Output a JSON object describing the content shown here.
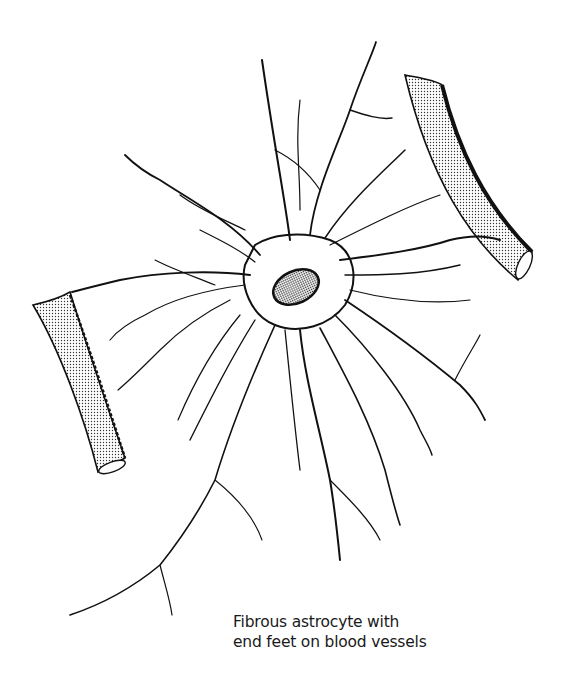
{
  "figure": {
    "subject": "Fibrous astrocyte",
    "caption_lines": [
      "Fibrous astrocyte with",
      "end feet on blood vessels"
    ],
    "elements": [
      "cell-body",
      "nucleus",
      "processes",
      "blood-vessel-left",
      "blood-vessel-right"
    ]
  },
  "colors": {
    "ink": "#111111",
    "background": "#ffffff"
  }
}
